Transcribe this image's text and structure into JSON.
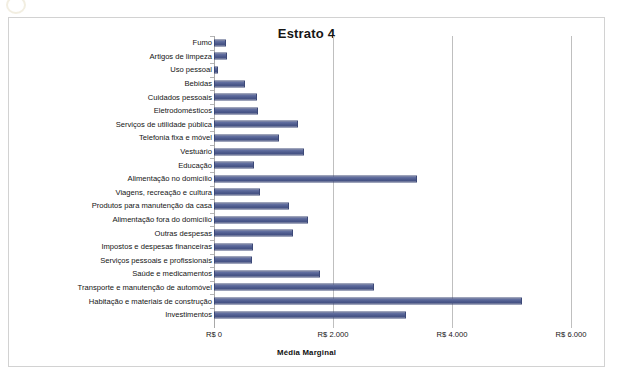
{
  "chart_data": {
    "type": "bar",
    "orientation": "horizontal",
    "title": "Estrato 4",
    "xlabel": "Média Marginal",
    "ylabel": "",
    "xlim": [
      0,
      6000
    ],
    "grid": true,
    "legend": false,
    "currency_prefix": "R$",
    "tick_labels": [
      "R$ 0",
      "R$ 2.000",
      "R$ 4.000",
      "R$ 6.000"
    ],
    "tick_values": [
      0,
      2000,
      4000,
      6000
    ],
    "bar_color": "#4e5b8d",
    "categories": [
      "Fumo",
      "Artigos de limpeza",
      "Uso pessoal",
      "Bebidas",
      "Cuidados pessoais",
      "Eletrodomésticos",
      "Serviços de utilidade pública",
      "Telefonia fixa e móvel",
      "Vestuário",
      "Educação",
      "Alimentação no domicílio",
      "Viagens, recreação e cultura",
      "Produtos para manutenção da casa",
      "Alimentação fora do domicílio",
      "Outras despesas",
      "Impostos e despesas financeiras",
      "Serviços pessoais e profissionais",
      "Saúde e medicamentos",
      "Transporte e manutenção de automóvel",
      "Habitação e materiais de construção",
      "Investimentos"
    ],
    "values": [
      200,
      220,
      60,
      520,
      720,
      740,
      1410,
      1090,
      1510,
      670,
      3410,
      770,
      1260,
      1580,
      1330,
      650,
      640,
      1780,
      2690,
      5180,
      3230
    ]
  }
}
